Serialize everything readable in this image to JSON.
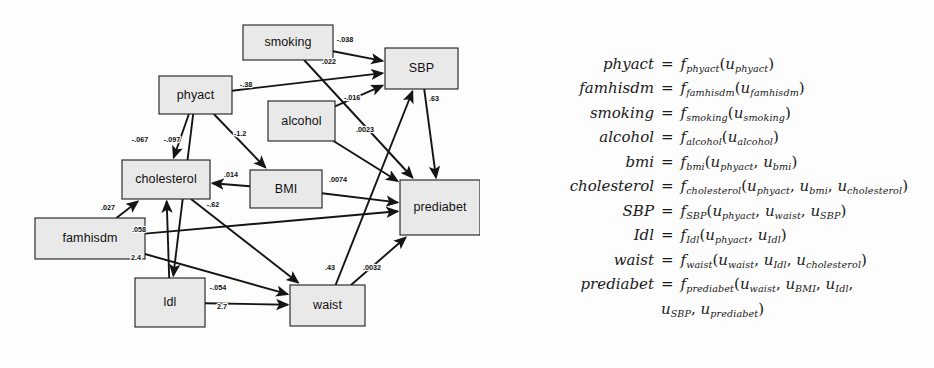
{
  "figure": {
    "type": "causal-dag-with-structural-equations",
    "background_color": "#fdfdfd",
    "node_fill": "#e9e9e9",
    "node_stroke": "#1c1c1c",
    "edge_color": "#141414"
  },
  "graph": {
    "nodes": [
      {
        "id": "smoking",
        "label": "smoking",
        "x": 243,
        "y": 25,
        "w": 90,
        "h": 35
      },
      {
        "id": "SBP",
        "label": "SBP",
        "x": 385,
        "y": 48,
        "w": 73,
        "h": 41
      },
      {
        "id": "phyact",
        "label": "phyact",
        "x": 159,
        "y": 76,
        "w": 73,
        "h": 38
      },
      {
        "id": "alcohol",
        "label": "alcohol",
        "x": 268,
        "y": 101,
        "w": 67,
        "h": 40
      },
      {
        "id": "cholesterol",
        "label": "cholesterol",
        "x": 122,
        "y": 160,
        "w": 88,
        "h": 39
      },
      {
        "id": "BMI",
        "label": "BMI",
        "x": 250,
        "y": 170,
        "w": 72,
        "h": 38
      },
      {
        "id": "prediabet",
        "label": "prediabet",
        "x": 400,
        "y": 180,
        "w": 80,
        "h": 55
      },
      {
        "id": "famhisdm",
        "label": "famhisdm",
        "x": 35,
        "y": 218,
        "w": 110,
        "h": 41
      },
      {
        "id": "ldl",
        "label": "ldl",
        "x": 135,
        "y": 278,
        "w": 70,
        "h": 49
      },
      {
        "id": "waist",
        "label": "waist",
        "x": 290,
        "y": 285,
        "w": 75,
        "h": 41
      }
    ],
    "edges": [
      {
        "from": "smoking",
        "to": "SBP",
        "weight": "-.038",
        "lx": 345,
        "ly": 40,
        "x1": 333,
        "y1": 48,
        "x2": 385,
        "y2": 66
      },
      {
        "from": "smoking",
        "to": "prediabet",
        "weight": ".022",
        "lx": 329,
        "ly": 62,
        "x1": 330,
        "y1": 55,
        "x2": 400,
        "y2": 192
      },
      {
        "from": "phyact",
        "to": "SBP",
        "weight": "-.38",
        "lx": 246,
        "ly": 85,
        "x1": 232,
        "y1": 92,
        "x2": 385,
        "y2": 68
      },
      {
        "from": "alcohol",
        "to": "SBP",
        "weight": "-.016",
        "lx": 352,
        "ly": 98,
        "x1": 335,
        "y1": 110,
        "x2": 400,
        "y2": 195
      },
      {
        "from": "alcohol",
        "to": "prediabet",
        "weight": ".0023",
        "lx": 365,
        "ly": 130,
        "x1": 335,
        "y1": 118,
        "x2": 400,
        "y2": 198
      },
      {
        "from": "SBP",
        "to": "prediabet",
        "weight": ".63",
        "lx": 434,
        "ly": 99,
        "x1": 432,
        "y1": 88,
        "x2": 438,
        "y2": 180
      },
      {
        "from": "phyact",
        "to": "cholesterol",
        "weight": "-.067",
        "lx": 140,
        "ly": 140,
        "x1": 186,
        "y1": 113,
        "x2": 166,
        "y2": 160
      },
      {
        "from": "phyact",
        "to": "ldl",
        "weight": "-.097",
        "lx": 172,
        "ly": 140,
        "x1": 190,
        "y1": 113,
        "x2": 172,
        "y2": 278
      },
      {
        "from": "phyact",
        "to": "BMI",
        "weight": "-1.2",
        "lx": 240,
        "ly": 134,
        "x1": 196,
        "y1": 113,
        "x2": 279,
        "y2": 170
      },
      {
        "from": "BMI",
        "to": "cholesterol",
        "weight": ".014",
        "lx": 231,
        "ly": 175,
        "x1": 250,
        "y1": 183,
        "x2": 210,
        "y2": 176
      },
      {
        "from": "BMI",
        "to": "prediabet",
        "weight": ".0074",
        "lx": 338,
        "ly": 180,
        "x1": 322,
        "y1": 185,
        "x2": 400,
        "y2": 205
      },
      {
        "from": "cholesterol",
        "to": "waist",
        "weight": "-.62",
        "lx": 213,
        "ly": 205,
        "x1": 203,
        "y1": 199,
        "x2": 290,
        "y2": 305
      },
      {
        "from": "famhisdm",
        "to": "cholesterol",
        "weight": ".027",
        "lx": 108,
        "ly": 208,
        "x1": 145,
        "y1": 233,
        "x2": 122,
        "y2": 195
      },
      {
        "from": "famhisdm",
        "to": "prediabet",
        "weight": ".058",
        "lx": 139,
        "ly": 230,
        "x1": 145,
        "y1": 238,
        "x2": 400,
        "y2": 205
      },
      {
        "from": "famhisdm",
        "to": "waist",
        "weight": "2.4",
        "lx": 136,
        "ly": 258,
        "x1": 145,
        "y1": 240,
        "x2": 290,
        "y2": 305
      },
      {
        "from": "ldl",
        "to": "cholesterol",
        "weight": "-.054",
        "lx": 218,
        "ly": 288,
        "x1": 205,
        "y1": 288,
        "x2": 205,
        "y2": 199
      },
      {
        "from": "ldl",
        "to": "waist",
        "weight": "2.7",
        "lx": 222,
        "ly": 307,
        "x1": 205,
        "y1": 305,
        "x2": 290,
        "y2": 305
      },
      {
        "from": "waist",
        "to": "SBP",
        "weight": ".43",
        "lx": 330,
        "ly": 268,
        "x1": 330,
        "y1": 285,
        "x2": 410,
        "y2": 89
      },
      {
        "from": "waist",
        "to": "prediabet",
        "weight": ".0032",
        "lx": 372,
        "ly": 268,
        "x1": 348,
        "y1": 285,
        "x2": 400,
        "y2": 228
      }
    ]
  },
  "equations": [
    {
      "lhs": "phyact",
      "fn": "f",
      "fn_sub": "phyact",
      "args": [
        {
          "base": "u",
          "sub": "phyact"
        }
      ]
    },
    {
      "lhs": "famhisdm",
      "fn": "f",
      "fn_sub": "famhisdm",
      "args": [
        {
          "base": "u",
          "sub": "famhisdm"
        }
      ]
    },
    {
      "lhs": "smoking",
      "fn": "f",
      "fn_sub": "smoking",
      "args": [
        {
          "base": "u",
          "sub": "smoking"
        }
      ]
    },
    {
      "lhs": "alcohol",
      "fn": "f",
      "fn_sub": "alcohol",
      "args": [
        {
          "base": "u",
          "sub": "alcohol"
        }
      ]
    },
    {
      "lhs": "bmi",
      "fn": "f",
      "fn_sub": "bmi",
      "args": [
        {
          "base": "u",
          "sub": "phyact"
        },
        {
          "base": "u",
          "sub": "bmi"
        }
      ]
    },
    {
      "lhs": "cholesterol",
      "fn": "f",
      "fn_sub": "cholesterol",
      "args": [
        {
          "base": "u",
          "sub": "phyact"
        },
        {
          "base": "u",
          "sub": "bmi"
        },
        {
          "base": "u",
          "sub": "cholesterol"
        }
      ]
    },
    {
      "lhs": "SBP",
      "fn": "f",
      "fn_sub": "SBP",
      "args": [
        {
          "base": "u",
          "sub": "phyact"
        },
        {
          "base": "u",
          "sub": "waist"
        },
        {
          "base": "u",
          "sub": "SBP"
        }
      ]
    },
    {
      "lhs": "Idl",
      "fn": "f",
      "fn_sub": "Idl",
      "args": [
        {
          "base": "u",
          "sub": "phyact"
        },
        {
          "base": "u",
          "sub": "Idl"
        }
      ]
    },
    {
      "lhs": "waist",
      "fn": "f",
      "fn_sub": "waist",
      "args": [
        {
          "base": "u",
          "sub": "waist"
        },
        {
          "base": "u",
          "sub": "Idl"
        },
        {
          "base": "u",
          "sub": "cholesterol"
        }
      ]
    },
    {
      "lhs": "prediabet",
      "fn": "f",
      "fn_sub": "prediabet",
      "args": [
        {
          "base": "u",
          "sub": "waist"
        },
        {
          "base": "u",
          "sub": "BMI"
        },
        {
          "base": "u",
          "sub": "Idl"
        }
      ],
      "args_line2": [
        {
          "base": "u",
          "sub": "SBP"
        },
        {
          "base": "u",
          "sub": "prediabet"
        }
      ]
    }
  ]
}
